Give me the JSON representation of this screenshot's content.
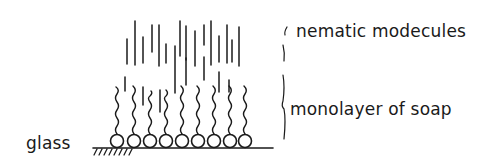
{
  "diagram": {
    "labels": {
      "nematic": "nematic modecules",
      "monolayer": "monolayer of soap",
      "substrate": "glass"
    },
    "colors": {
      "ink": "#1a1a1a",
      "background": "#ffffff"
    },
    "structure": {
      "soap_head_count": 9,
      "description": "Soap molecule monolayer (round heads on glass, wavy tails upward) with nematic molecules (vertical rods) aligned above"
    }
  }
}
